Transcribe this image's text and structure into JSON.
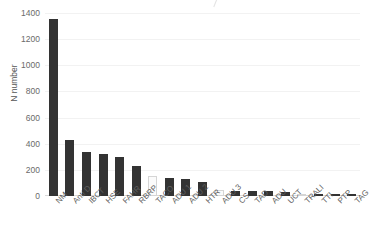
{
  "chart_data": {
    "type": "bar",
    "title": "",
    "subtitle": "",
    "xlabel": "",
    "ylabel": "N number",
    "ylim": [
      0,
      1400
    ],
    "yticks": [
      0,
      200,
      400,
      600,
      800,
      1000,
      1200,
      1400
    ],
    "grid": true,
    "legend": false,
    "categories": [
      "NM",
      "Anti D",
      "IBCT",
      "HSE",
      "FAHR",
      "RBRP",
      "TACO",
      "ADU 1",
      "ADU 2",
      "HTR",
      "ADU 3",
      "CS",
      "TAD",
      "ADU",
      "UCT",
      "TRALI",
      "TTI",
      "PTP",
      "TAG"
    ],
    "values": [
      1355,
      430,
      340,
      320,
      300,
      230,
      150,
      140,
      130,
      110,
      45,
      40,
      38,
      35,
      30,
      12,
      10,
      9,
      8
    ],
    "bar_styles": [
      "dark",
      "dark",
      "dark",
      "dark",
      "dark",
      "dark",
      "light",
      "dark",
      "dark",
      "dark",
      "light",
      "dark",
      "dark",
      "dark",
      "dark",
      "light",
      "dark",
      "dark",
      "dark"
    ],
    "colors": {
      "bar_dark": "#333333",
      "bar_light": "#fbfbfb",
      "bar_light_border": "#d5d5d5",
      "gridline": "#f2f2f2",
      "axis": "#d9d9d9",
      "tick_text": "#6a6a6a",
      "label_text": "#5e5e5e",
      "background": "#ffffff"
    }
  }
}
